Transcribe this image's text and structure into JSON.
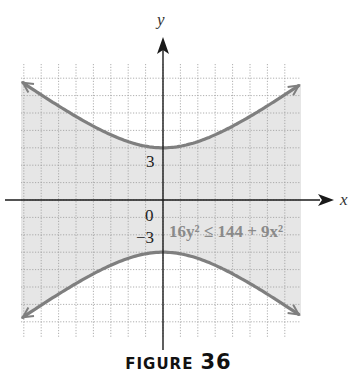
{
  "figure": {
    "caption_word": "FIGURE",
    "caption_number": "36",
    "axis_labels": {
      "x": "x",
      "y": "y"
    },
    "tick_labels": {
      "origin": "0",
      "y_pos": "3",
      "y_neg": "−3"
    },
    "inequality_label": "16y² ≤ 144 + 9x²",
    "colors": {
      "curve": "#7f7f7f",
      "shade": "#e6e6e6",
      "grid": "#9a9a9a",
      "axis": "#1a1a1a"
    }
  },
  "chart_data": {
    "type": "region",
    "title": "FIGURE 36",
    "inequality": "16y^2 <= 144 + 9x^2",
    "boundary": "hyperbola y^2/9 - x^2/16 = 1",
    "vertices": [
      [
        0,
        3
      ],
      [
        0,
        -3
      ]
    ],
    "labels": [
      "0",
      "3",
      "-3",
      "x",
      "y"
    ],
    "shaded_region": "between the two branches (contains origin)",
    "xlim": [
      -8,
      8
    ],
    "ylim": [
      -8,
      8
    ],
    "grid": true
  }
}
